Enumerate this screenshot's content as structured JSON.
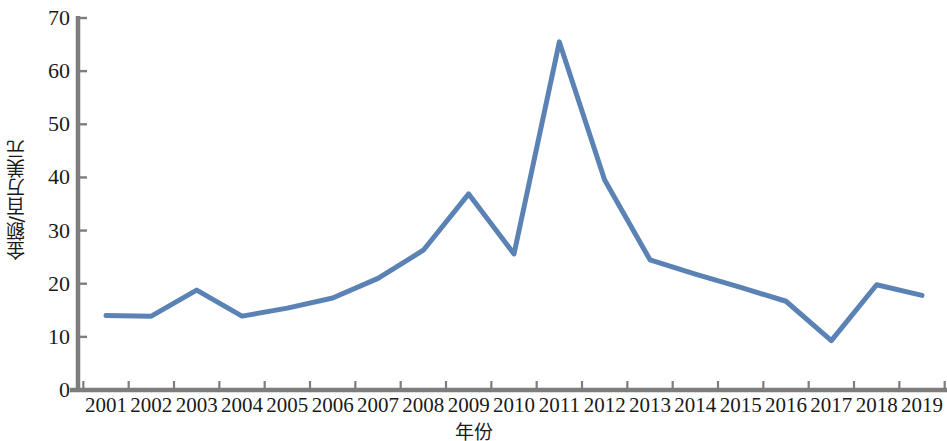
{
  "chart_data": {
    "type": "line",
    "title": "",
    "subtitle": "",
    "xlabel": "年份",
    "ylabel": "金额/百万美元",
    "categories": [
      "2001",
      "2002",
      "2003",
      "2004",
      "2005",
      "2006",
      "2007",
      "2008",
      "2009",
      "2010",
      "2011",
      "2012",
      "2013",
      "2014",
      "2015",
      "2016",
      "2017",
      "2018",
      "2019"
    ],
    "values": [
      14.0,
      13.9,
      18.8,
      13.9,
      15.4,
      17.3,
      21.0,
      26.3,
      36.9,
      25.6,
      65.5,
      39.5,
      24.5,
      21.8,
      19.3,
      16.7,
      9.3,
      19.8,
      17.8
    ],
    "series": [
      {
        "name": "金额",
        "values": [
          14.0,
          13.9,
          18.8,
          13.9,
          15.4,
          17.3,
          21.0,
          26.3,
          36.9,
          25.6,
          65.5,
          39.5,
          24.5,
          21.8,
          19.3,
          16.7,
          9.3,
          19.8,
          17.8
        ],
        "color": "#5B82B4"
      }
    ],
    "ylim": [
      0,
      70
    ],
    "ytick_values": [
      0,
      10,
      20,
      30,
      40,
      50,
      60,
      70
    ],
    "ytick_labels": [
      "0",
      "10",
      "20",
      "30",
      "40",
      "50",
      "60",
      "70"
    ],
    "xtick_labels": [
      "2001",
      "2002",
      "2003",
      "2004",
      "2005",
      "2006",
      "2007",
      "2008",
      "2009",
      "2010",
      "2011",
      "2012",
      "2013",
      "2014",
      "2015",
      "2016",
      "2017",
      "2018",
      "2019"
    ],
    "grid": false,
    "legend": false,
    "legend_position": "none",
    "annotations": [],
    "colors": {
      "line": "#5B82B4",
      "axis": "#7d7d7d",
      "text": "#1a1a1a",
      "background": "#ffffff"
    },
    "line_width": 5
  }
}
